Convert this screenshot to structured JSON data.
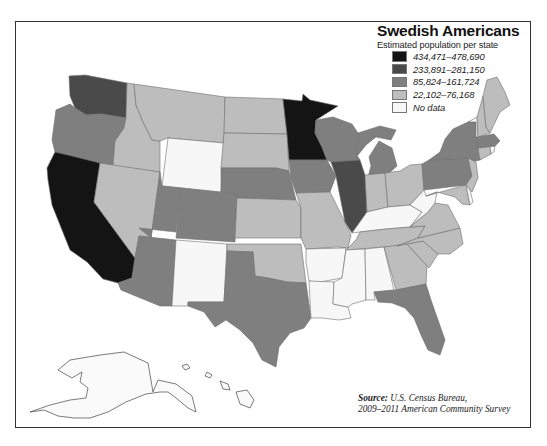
{
  "title": "Swedish Americans",
  "subtitle": "Estimated population per state",
  "legend": [
    {
      "label": "434,471–478,690",
      "category": "c1",
      "color": "#141414"
    },
    {
      "label": "233,891–281,150",
      "category": "c2",
      "color": "#4a4a4a"
    },
    {
      "label": "85,824–161,724",
      "category": "c3",
      "color": "#7f7f7f"
    },
    {
      "label": "22,102–76,168",
      "category": "c4",
      "color": "#bdbdbd"
    },
    {
      "label": "No data",
      "category": "nd",
      "color": "#f7f7f7"
    }
  ],
  "source": {
    "label": "Source:",
    "line1": "U.S. Census Bureau,",
    "line2": "2009–2011 American Community Survey"
  },
  "chart_data": {
    "type": "choropleth",
    "title": "Swedish Americans",
    "subtitle": "Estimated population per state",
    "bins": [
      {
        "key": "c1",
        "range": "434,471–478,690"
      },
      {
        "key": "c2",
        "range": "233,891–281,150"
      },
      {
        "key": "c3",
        "range": "85,824–161,724"
      },
      {
        "key": "c4",
        "range": "22,102–76,168"
      },
      {
        "key": "nd",
        "range": "No data"
      }
    ],
    "states": {
      "WA": "c2",
      "OR": "c3",
      "CA": "c1",
      "ID": "c4",
      "NV": "c4",
      "MT": "c4",
      "WY": "nd",
      "UT": "c3",
      "AZ": "c3",
      "CO": "c3",
      "NM": "nd",
      "ND": "c4",
      "SD": "c4",
      "NE": "c3",
      "KS": "c4",
      "OK": "c4",
      "TX": "c3",
      "MN": "c1",
      "IA": "c3",
      "MO": "c4",
      "AR": "nd",
      "LA": "nd",
      "WI": "c3",
      "IL": "c2",
      "MI": "c3",
      "IN": "c4",
      "OH": "c4",
      "KY": "nd",
      "TN": "c4",
      "MS": "nd",
      "AL": "nd",
      "GA": "c4",
      "FL": "c3",
      "SC": "c4",
      "NC": "c4",
      "VA": "c4",
      "WV": "nd",
      "PA": "c3",
      "NY": "c3",
      "MD": "c4",
      "DE": "nd",
      "NJ": "c4",
      "CT": "c4",
      "RI": "nd",
      "MA": "c3",
      "VT": "nd",
      "NH": "c4",
      "ME": "c4",
      "AK": "nd",
      "HI": "nd"
    },
    "source": "U.S. Census Bureau, 2009–2011 American Community Survey"
  }
}
